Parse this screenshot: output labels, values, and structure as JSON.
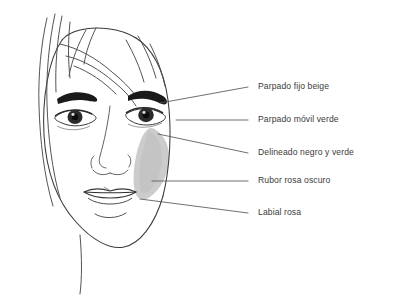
{
  "illustration": {
    "subject": "womans-face-makeup-diagram",
    "background_color": "#ffffff",
    "line_color": "#3a3a3a",
    "blush_color": "#c9c9c9",
    "brow_color": "#1a1a1a",
    "iris_color": "#2b2b2b",
    "leader_line_color": "#555555"
  },
  "annotations": [
    {
      "id": "parpado-fijo-beige",
      "label": "Parpado fijo beige",
      "text_x": 258,
      "text_y": 88,
      "leader": {
        "x1": 248,
        "y1": 87,
        "x2": 160,
        "y2": 103
      }
    },
    {
      "id": "parpado-movil-verde",
      "label": "Parpado móvil verde",
      "text_x": 258,
      "text_y": 121,
      "leader": {
        "x1": 248,
        "y1": 120,
        "x2": 176,
        "y2": 120
      }
    },
    {
      "id": "delineado-negro-y-verde",
      "label": "Delineado negro y verde",
      "text_x": 258,
      "text_y": 154,
      "leader": {
        "x1": 248,
        "y1": 153,
        "x2": 158,
        "y2": 134
      }
    },
    {
      "id": "rubor-rosa-oscuro",
      "label": "Rubor rosa oscuro",
      "text_x": 258,
      "text_y": 182,
      "leader": {
        "x1": 248,
        "y1": 181,
        "x2": 152,
        "y2": 181
      }
    },
    {
      "id": "labial-rosa",
      "label": "Labial rosa",
      "text_x": 258,
      "text_y": 214,
      "leader": {
        "x1": 248,
        "y1": 213,
        "x2": 140,
        "y2": 199
      }
    }
  ]
}
